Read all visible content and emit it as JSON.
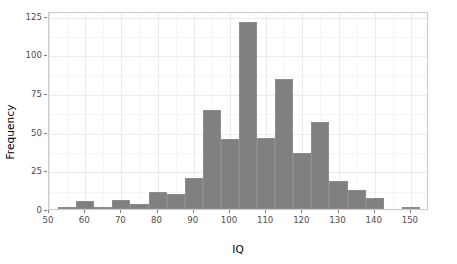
{
  "chart_data": {
    "type": "bar",
    "subtype": "histogram",
    "title": "",
    "xlabel": "IQ",
    "ylabel": "Frequency",
    "xlim": [
      50,
      155
    ],
    "ylim": [
      0,
      128
    ],
    "xticks": [
      50,
      60,
      70,
      80,
      90,
      100,
      110,
      120,
      130,
      140,
      150
    ],
    "xtick_labels": [
      "50",
      "60",
      "70",
      "80",
      "90",
      "100",
      "110",
      "120",
      "130",
      "140",
      "150"
    ],
    "yticks": [
      0,
      25,
      50,
      75,
      100,
      125
    ],
    "ytick_labels": [
      "0",
      "25",
      "50",
      "75",
      "100",
      "125"
    ],
    "grid": true,
    "legend": "none",
    "bin_width": 5,
    "bar_color": "#808080",
    "panel_border_color": "#c9c9c9",
    "gridline_color": "#ebebeb",
    "bins": [
      {
        "x0": 52.5,
        "x1": 57.5,
        "center": 55,
        "value": 1
      },
      {
        "x0": 57.5,
        "x1": 62.5,
        "center": 60,
        "value": 5
      },
      {
        "x0": 62.5,
        "x1": 67.5,
        "center": 65,
        "value": 0
      },
      {
        "x0": 67.5,
        "x1": 72.5,
        "center": 70,
        "value": 6
      },
      {
        "x0": 72.5,
        "x1": 77.5,
        "center": 75,
        "value": 3
      },
      {
        "x0": 77.5,
        "x1": 82.5,
        "center": 80,
        "value": 11
      },
      {
        "x0": 82.5,
        "x1": 87.5,
        "center": 85,
        "value": 10
      },
      {
        "x0": 87.5,
        "x1": 92.5,
        "center": 90,
        "value": 20
      },
      {
        "x0": 92.5,
        "x1": 97.5,
        "center": 95,
        "value": 64
      },
      {
        "x0": 97.5,
        "x1": 102.5,
        "center": 100,
        "value": 45
      },
      {
        "x0": 102.5,
        "x1": 107.5,
        "center": 105,
        "value": 121
      },
      {
        "x0": 107.5,
        "x1": 112.5,
        "center": 110,
        "value": 46
      },
      {
        "x0": 112.5,
        "x1": 117.5,
        "center": 115,
        "value": 84
      },
      {
        "x0": 117.5,
        "x1": 122.5,
        "center": 120,
        "value": 36
      },
      {
        "x0": 122.5,
        "x1": 127.5,
        "center": 125,
        "value": 56
      },
      {
        "x0": 127.5,
        "x1": 132.5,
        "center": 130,
        "value": 18
      },
      {
        "x0": 132.5,
        "x1": 137.5,
        "center": 135,
        "value": 12
      },
      {
        "x0": 137.5,
        "x1": 142.5,
        "center": 140,
        "value": 7
      },
      {
        "x0": 147.5,
        "x1": 152.5,
        "center": 150,
        "value": 1
      }
    ]
  }
}
